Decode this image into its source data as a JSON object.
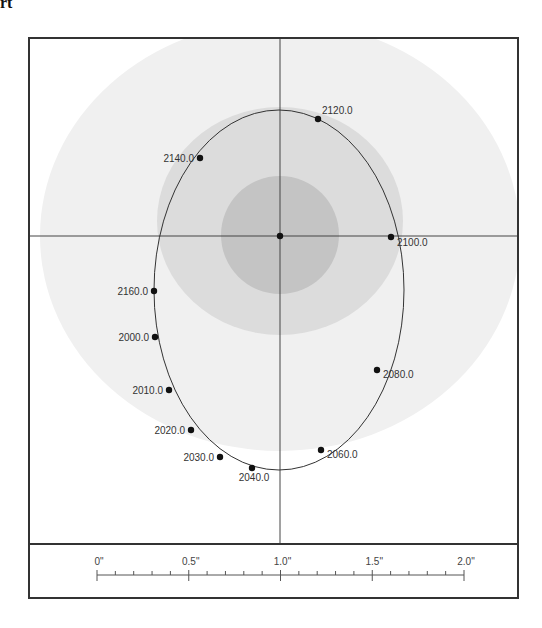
{
  "header": {
    "corner_text": "rt"
  },
  "diagram": {
    "type": "orbit-plot",
    "center_marker": "primary-star",
    "orbit_points": [
      {
        "label": "2000.0",
        "x": 155,
        "y": 337,
        "label_side": "left"
      },
      {
        "label": "2010.0",
        "x": 169,
        "y": 390,
        "label_side": "left"
      },
      {
        "label": "2020.0",
        "x": 191,
        "y": 430,
        "label_side": "left"
      },
      {
        "label": "2030.0",
        "x": 220,
        "y": 457,
        "label_side": "left"
      },
      {
        "label": "2040.0",
        "x": 252,
        "y": 468,
        "label_side": "below"
      },
      {
        "label": "2060.0",
        "x": 321,
        "y": 450,
        "label_side": "right"
      },
      {
        "label": "2080.0",
        "x": 377,
        "y": 370,
        "label_side": "right"
      },
      {
        "label": "2100.0",
        "x": 391,
        "y": 237,
        "label_side": "right"
      },
      {
        "label": "2120.0",
        "x": 318,
        "y": 119,
        "label_side": "right"
      },
      {
        "label": "2140.0",
        "x": 200,
        "y": 158,
        "label_side": "left"
      },
      {
        "label": "2160.0",
        "x": 154,
        "y": 291,
        "label_side": "left"
      }
    ],
    "zones": [
      {
        "name": "outer-zone",
        "color": "#f0f0f0"
      },
      {
        "name": "middle-zone",
        "color": "#dcdcdc"
      },
      {
        "name": "inner-zone",
        "color": "#c4c4c4"
      }
    ],
    "line_color": "#333333"
  },
  "scale_bar": {
    "labels": [
      "0\"",
      "0.5\"",
      "1.0\"",
      "1.5\"",
      "2.0\""
    ],
    "minor_ticks_per_unit": 10,
    "unit": "arcsec"
  }
}
